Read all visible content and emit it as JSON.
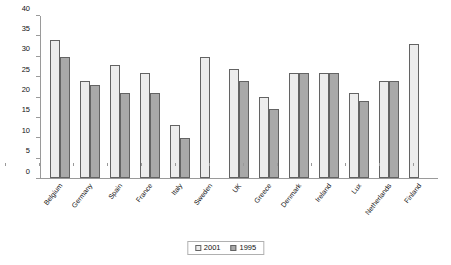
{
  "chart_data": {
    "type": "bar",
    "title": "",
    "subtitle": "",
    "xlabel": "",
    "ylabel": "",
    "ylim": [
      0,
      40
    ],
    "ytick_step": 5,
    "yticks": [
      0,
      5,
      10,
      15,
      20,
      25,
      30,
      35,
      40
    ],
    "grid": false,
    "legend_position": "bottom-center",
    "categories": [
      "Belgium",
      "Germany",
      "Spain",
      "France",
      "Italy",
      "Sweden",
      "UK",
      "Greece",
      "Denmark",
      "Ireland",
      "Lux",
      "Netherlands",
      "Finland"
    ],
    "series": [
      {
        "name": "2001",
        "color": "#ededed",
        "values": [
          34,
          24,
          28,
          26,
          13,
          30,
          27,
          20,
          26,
          26,
          21,
          24,
          33
        ]
      },
      {
        "name": "1995",
        "color": "#a9a9a9",
        "values": [
          30,
          23,
          21,
          21,
          10,
          null,
          24,
          17,
          26,
          26,
          19,
          24,
          null
        ]
      }
    ]
  },
  "legend": {
    "items": [
      {
        "label": "2001"
      },
      {
        "label": "1995"
      }
    ]
  },
  "colors": {
    "series_2001": "#ededed",
    "series_1995": "#a9a9a9",
    "bar_outline": "#636363",
    "axis": "#9a9a9a",
    "background": "#ffffff",
    "text": "#111111"
  }
}
